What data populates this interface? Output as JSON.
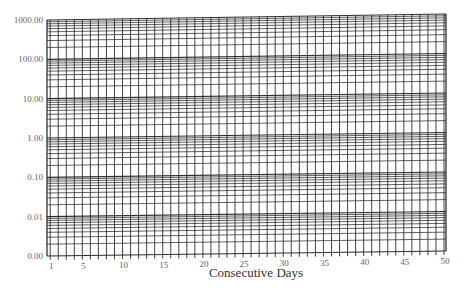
{
  "chart_data": {
    "type": "line",
    "title": "",
    "xlabel": "Consecutive Days",
    "ylabel": "",
    "x_scale": "linear",
    "y_scale": "log",
    "xlim": [
      1,
      50
    ],
    "ylim": [
      0.001,
      1000
    ],
    "x_tick_values": [
      1,
      5,
      10,
      15,
      20,
      25,
      30,
      35,
      40,
      45,
      50
    ],
    "x_tick_labels": [
      "1",
      "5",
      "10",
      "15",
      "20",
      "25",
      "30",
      "35",
      "40",
      "45",
      "50"
    ],
    "y_tick_values": [
      0.001,
      0.01,
      0.1,
      1,
      10,
      100,
      1000
    ],
    "y_tick_labels": [
      "0.00",
      "0.01",
      "0.10",
      "1.00",
      "10.00",
      "100.00",
      "1000.00"
    ],
    "grid": true,
    "grid_minor_y": "log decades subdivided 1-10",
    "grid_minor_x": "every day",
    "series": [],
    "legend": null
  },
  "colors": {
    "grid_line": "#222222",
    "background": "#ffffff",
    "tick_text": "#666666",
    "axis_label": "#333333"
  }
}
